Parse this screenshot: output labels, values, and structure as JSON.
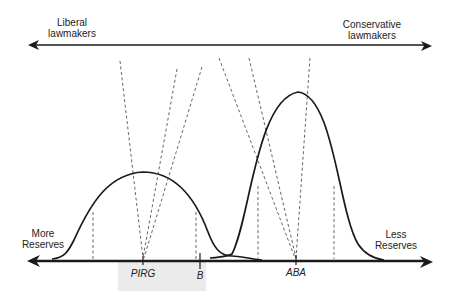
{
  "diagram": {
    "top_axis": {
      "left_label_line1": "Liberal",
      "left_label_line2": "lawmakers",
      "right_label_line1": "Conservative",
      "right_label_line2": "lawmakers"
    },
    "bottom_axis": {
      "left_label_line1": "More",
      "left_label_line2": "Reserves",
      "right_label_line1": "Less",
      "right_label_line2": "Reserves"
    },
    "points": [
      {
        "label": "PIRG"
      },
      {
        "label": "B"
      },
      {
        "label": "ABA"
      }
    ],
    "colors": {
      "line": "#1a1a1a",
      "dashed": "#555555",
      "shade": "#e8e8e8"
    }
  }
}
